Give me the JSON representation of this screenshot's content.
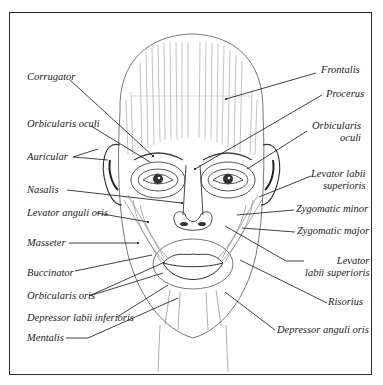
{
  "diagram": {
    "left_labels": [
      {
        "id": "corrugator",
        "text": "Corrugator",
        "x": 27,
        "y": 77
      },
      {
        "id": "orbicularis-oculi-left",
        "text": "Orbicularis oculi",
        "x": 27,
        "y": 124
      },
      {
        "id": "auricular",
        "text": "Auricular",
        "x": 27,
        "y": 152
      },
      {
        "id": "nasalis",
        "text": "Nasalis",
        "x": 27,
        "y": 185
      },
      {
        "id": "levator-anguli-oris",
        "text": "Levator anguli oris",
        "x": 27,
        "y": 209
      },
      {
        "id": "masseter",
        "text": "Masseter",
        "x": 27,
        "y": 238
      },
      {
        "id": "buccinator",
        "text": "Buccinator",
        "x": 27,
        "y": 268
      },
      {
        "id": "orbicularis-oris",
        "text": "Orbicularis oris",
        "x": 27,
        "y": 291
      },
      {
        "id": "depressor-labii-inferioris",
        "text": "Depressor labii inferioris",
        "x": 27,
        "y": 313
      },
      {
        "id": "mentalis",
        "text": "Mentalis",
        "x": 27,
        "y": 333
      }
    ],
    "right_labels": [
      {
        "id": "frontalis",
        "text": "Frontalis",
        "x": 318,
        "y": 70
      },
      {
        "id": "procerus",
        "text": "Procerus",
        "x": 325,
        "y": 92
      },
      {
        "id": "orbicularis-oculi-right",
        "text": "Orbicularis\noculi",
        "x": 311,
        "y": 127
      },
      {
        "id": "levator-labii-superioris-upper",
        "text": "Levator labii\nsuperioris",
        "x": 314,
        "y": 173
      },
      {
        "id": "zygomatic-minor",
        "text": "Zygomatic minor",
        "x": 296,
        "y": 207
      },
      {
        "id": "zygomatic-major",
        "text": "Zygomatic major",
        "x": 297,
        "y": 229
      },
      {
        "id": "levator-labii-superioris-lower",
        "text": "Levator\nlabii superioris",
        "x": 306,
        "y": 258
      },
      {
        "id": "risorius",
        "text": "Risorius",
        "x": 330,
        "y": 300
      },
      {
        "id": "depressor-anguli-oris",
        "text": "Depressor anguli oris",
        "x": 277,
        "y": 327
      }
    ],
    "colors": {
      "ink": "#1a1a1a",
      "frame": "#2a2a2a",
      "shade": "#8a8a8a",
      "paper": "#ffffff"
    }
  }
}
